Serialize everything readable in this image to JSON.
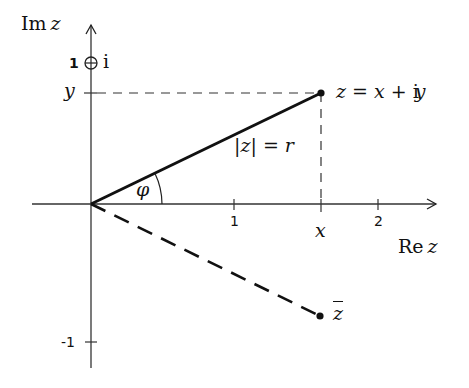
{
  "diagram": {
    "colors": {
      "ink": "#111111",
      "background": "#ffffff"
    },
    "axes": {
      "real_axis_label": {
        "prefix": "Re",
        "var": "z"
      },
      "imag_axis_label": {
        "prefix": "Im",
        "var": "z"
      },
      "x_ticks": [
        "1",
        "2"
      ],
      "y_ticks": [
        "1",
        "-1"
      ],
      "x_var_tick": "x",
      "y_var_tick": "y",
      "imaginary_unit_marker": "⊕",
      "imaginary_unit_label": "i"
    },
    "labels": {
      "z_point": "z = x + iy",
      "z_point_parts": {
        "lhs": "z",
        "eq": "=",
        "x": "x",
        "plus": "+",
        "i": "i",
        "y": "y"
      },
      "modulus": {
        "bar_z": "|z|",
        "eq": "=",
        "r": "r"
      },
      "angle": "φ",
      "conjugate": "z"
    },
    "points": [
      {
        "name": "z",
        "x": 1.55,
        "y": 0.79
      },
      {
        "name": "z_conjugate",
        "x": 1.55,
        "y": -0.79
      }
    ]
  }
}
